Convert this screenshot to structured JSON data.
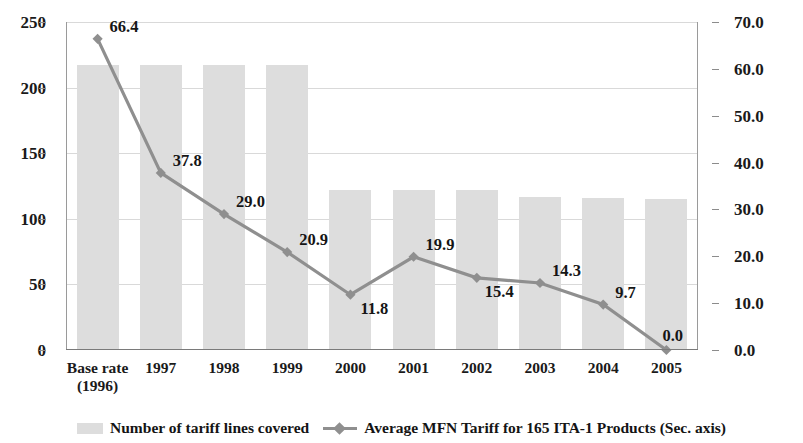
{
  "chart_data": {
    "type": "bar",
    "title": "",
    "subtitle": "",
    "xlabel": "",
    "ylabel": "",
    "grid": true,
    "legend_position": "bottom",
    "categories": [
      "Base rate\n(1996)",
      "1997",
      "1998",
      "1999",
      "2000",
      "2001",
      "2002",
      "2003",
      "2004",
      "2005"
    ],
    "category_lines": [
      [
        "Base rate",
        "(1996)"
      ],
      [
        "1997",
        ""
      ],
      [
        "1998",
        ""
      ],
      [
        "1999",
        ""
      ],
      [
        "2000",
        ""
      ],
      [
        "2001",
        ""
      ],
      [
        "2002",
        ""
      ],
      [
        "2003",
        ""
      ],
      [
        "2004",
        ""
      ],
      [
        "2005",
        ""
      ]
    ],
    "series": [
      {
        "name": "Number of tariff lines covered",
        "type": "bar",
        "axis": "left",
        "color": "#dddddd",
        "values": [
          217,
          217,
          217,
          217,
          122,
          122,
          122,
          117,
          116,
          115
        ]
      },
      {
        "name": "Average MFN Tariff for 165 ITA-1 Products (Sec. axis)",
        "type": "line",
        "axis": "right",
        "color": "#8f8f8f",
        "marker": "diamond",
        "values": [
          66.4,
          37.8,
          29.0,
          20.9,
          11.8,
          19.9,
          15.4,
          14.3,
          9.7,
          0.0
        ],
        "data_labels": [
          "66.4",
          "37.8",
          "29.0",
          "20.9",
          "11.8",
          "19.9",
          "15.4",
          "14.3",
          "9.7",
          "0.0"
        ]
      }
    ],
    "y_left": {
      "min": 0,
      "max": 250,
      "step": 50,
      "ticks": [
        0,
        50,
        100,
        150,
        200,
        250
      ],
      "tick_labels": [
        "0",
        "50",
        "100",
        "150",
        "200",
        "250"
      ]
    },
    "y_right": {
      "min": 0,
      "max": 70,
      "step": 10,
      "ticks": [
        0,
        10,
        20,
        30,
        40,
        50,
        60,
        70
      ],
      "tick_labels": [
        "0.0",
        "10.0",
        "20.0",
        "30.0",
        "40.0",
        "50.0",
        "60.0",
        "70.0"
      ]
    }
  },
  "legend": {
    "bar_label": "Number of tariff lines covered",
    "line_label": "Average MFN Tariff for 165 ITA-1 Products (Sec. axis)"
  },
  "colors": {
    "bar": "#dddddd",
    "line": "#8f8f8f",
    "grid": "#d9d9d9",
    "axis": "#8c8c8c",
    "text": "#1a1a1a",
    "background": "#ffffff"
  }
}
